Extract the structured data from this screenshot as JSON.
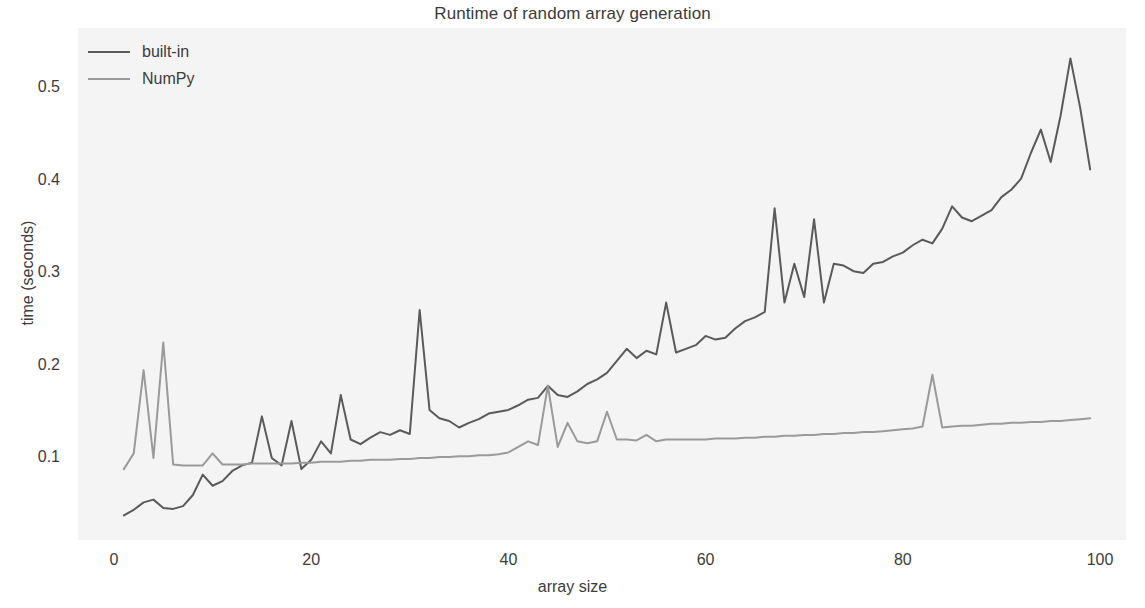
{
  "chart_data": {
    "type": "line",
    "title": "Runtime of random array generation",
    "xlabel": "array size",
    "ylabel": "time (seconds)",
    "xlim": [
      0,
      100
    ],
    "ylim": [
      0.02,
      0.56
    ],
    "xticks": [
      0,
      20,
      40,
      60,
      80,
      100
    ],
    "yticks": [
      0.1,
      0.2,
      0.3,
      0.4,
      0.5
    ],
    "xtick_labels": [
      "0",
      "20",
      "40",
      "60",
      "80",
      "100"
    ],
    "ytick_labels": [
      "0.1",
      "0.2",
      "0.3",
      "0.4",
      "0.5"
    ],
    "grid": false,
    "legend_position": "upper left",
    "plot_background": "#f4f4f4",
    "figure_background": "#ffffff",
    "x": [
      1,
      2,
      3,
      4,
      5,
      6,
      7,
      8,
      9,
      10,
      11,
      12,
      13,
      14,
      15,
      16,
      17,
      18,
      19,
      20,
      21,
      22,
      23,
      24,
      25,
      26,
      27,
      28,
      29,
      30,
      31,
      32,
      33,
      34,
      35,
      36,
      37,
      38,
      39,
      40,
      41,
      42,
      43,
      44,
      45,
      46,
      47,
      48,
      49,
      50,
      51,
      52,
      53,
      54,
      55,
      56,
      57,
      58,
      59,
      60,
      61,
      62,
      63,
      64,
      65,
      66,
      67,
      68,
      69,
      70,
      71,
      72,
      73,
      74,
      75,
      76,
      77,
      78,
      79,
      80,
      81,
      82,
      83,
      84,
      85,
      86,
      87,
      88,
      89,
      90,
      91,
      92,
      93,
      94,
      95,
      96,
      97,
      98,
      99
    ],
    "series": [
      {
        "name": "built-in",
        "color": "#5a5a5a",
        "linewidth": 2.0,
        "values": [
          0.038,
          0.044,
          0.052,
          0.055,
          0.046,
          0.045,
          0.048,
          0.06,
          0.082,
          0.07,
          0.075,
          0.086,
          0.092,
          0.095,
          0.145,
          0.1,
          0.092,
          0.14,
          0.088,
          0.098,
          0.118,
          0.105,
          0.168,
          0.12,
          0.115,
          0.122,
          0.128,
          0.125,
          0.13,
          0.126,
          0.26,
          0.152,
          0.143,
          0.14,
          0.133,
          0.138,
          0.142,
          0.148,
          0.15,
          0.152,
          0.157,
          0.163,
          0.165,
          0.178,
          0.168,
          0.166,
          0.172,
          0.18,
          0.185,
          0.192,
          0.205,
          0.218,
          0.208,
          0.216,
          0.212,
          0.268,
          0.214,
          0.218,
          0.222,
          0.232,
          0.228,
          0.23,
          0.24,
          0.248,
          0.252,
          0.258,
          0.37,
          0.268,
          0.31,
          0.274,
          0.358,
          0.268,
          0.31,
          0.308,
          0.302,
          0.3,
          0.31,
          0.312,
          0.318,
          0.322,
          0.33,
          0.336,
          0.332,
          0.348,
          0.372,
          0.36,
          0.356,
          0.362,
          0.368,
          0.382,
          0.39,
          0.402,
          0.43,
          0.455,
          0.42,
          0.47,
          0.532,
          0.478,
          0.412
        ]
      },
      {
        "name": "NumPy",
        "color": "#9a9a9a",
        "linewidth": 2.0,
        "values": [
          0.088,
          0.105,
          0.195,
          0.1,
          0.225,
          0.093,
          0.092,
          0.092,
          0.092,
          0.105,
          0.093,
          0.093,
          0.093,
          0.094,
          0.094,
          0.094,
          0.094,
          0.094,
          0.095,
          0.095,
          0.096,
          0.096,
          0.096,
          0.097,
          0.097,
          0.098,
          0.098,
          0.098,
          0.099,
          0.099,
          0.1,
          0.1,
          0.101,
          0.101,
          0.102,
          0.102,
          0.103,
          0.103,
          0.104,
          0.106,
          0.112,
          0.118,
          0.114,
          0.178,
          0.112,
          0.138,
          0.118,
          0.116,
          0.118,
          0.15,
          0.12,
          0.12,
          0.119,
          0.125,
          0.118,
          0.12,
          0.12,
          0.12,
          0.12,
          0.12,
          0.121,
          0.121,
          0.121,
          0.122,
          0.122,
          0.123,
          0.123,
          0.124,
          0.124,
          0.125,
          0.125,
          0.126,
          0.126,
          0.127,
          0.127,
          0.128,
          0.128,
          0.129,
          0.13,
          0.131,
          0.132,
          0.134,
          0.19,
          0.133,
          0.134,
          0.135,
          0.135,
          0.136,
          0.137,
          0.137,
          0.138,
          0.138,
          0.139,
          0.139,
          0.14,
          0.14,
          0.141,
          0.142,
          0.143
        ]
      }
    ]
  },
  "legend": {
    "items": [
      {
        "label": "built-in"
      },
      {
        "label": "NumPy"
      }
    ]
  }
}
